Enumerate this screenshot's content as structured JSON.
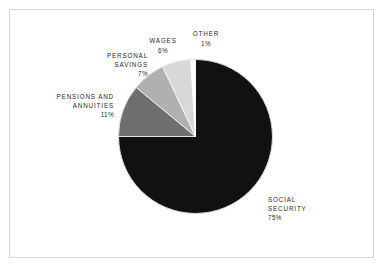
{
  "figure": {
    "background_color": "#ffffff",
    "frame_color": "#d6d6d6",
    "label_color": "#2b2b2b"
  },
  "chart_data": {
    "type": "pie",
    "title": "",
    "subtitle": "",
    "xlabel": "",
    "ylabel": "",
    "legend_position": "none",
    "grid": false,
    "start_angle_deg": 0,
    "direction": "clockwise",
    "units": "percent",
    "categories": [
      "SOCIAL SECURITY",
      "PENSIONS AND ANNUITIES",
      "PERSONAL SAVINGS",
      "WAGES",
      "OTHER"
    ],
    "values": [
      75,
      11,
      7,
      6,
      1
    ],
    "colors": [
      "#111111",
      "#6e6e6e",
      "#b0b0b0",
      "#d8d8d8",
      "#fcfcfc"
    ],
    "slices": [
      {
        "name": "SOCIAL SECURITY",
        "label": "SOCIAL\nSECURITY",
        "value": 75,
        "percent_text": "75%",
        "color": "#111111"
      },
      {
        "name": "PENSIONS AND ANNUITIES",
        "label": "PENSIONS AND\nANNUITIES",
        "value": 11,
        "percent_text": "11%",
        "color": "#6e6e6e"
      },
      {
        "name": "PERSONAL SAVINGS",
        "label": "PERSONAL\nSAVINGS",
        "value": 7,
        "percent_text": "7%",
        "color": "#b0b0b0"
      },
      {
        "name": "WAGES",
        "label": "WAGES",
        "value": 6,
        "percent_text": "6%",
        "color": "#d8d8d8"
      },
      {
        "name": "OTHER",
        "label": "OTHER",
        "value": 1,
        "percent_text": "1%",
        "color": "#fcfcfc"
      }
    ]
  }
}
